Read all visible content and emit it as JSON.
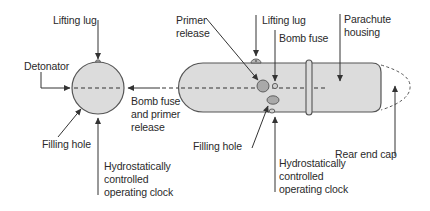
{
  "diagram": {
    "type": "technical-cutaway",
    "colors": {
      "background": "#ffffff",
      "body_fill": "#d9d9d9",
      "outline": "#444444",
      "component_fill": "#a9a9a9",
      "text": "#2a2a2a"
    },
    "left_sphere": {
      "labels": {
        "lifting_lug": "Lifting lug",
        "detonator": "Detonator",
        "filling_hole": "Filling hole",
        "clock": [
          "Hydrostatically",
          "controlled",
          "operating clock"
        ]
      }
    },
    "connector": {
      "label": [
        "Bomb fuse",
        "and primer",
        "release"
      ]
    },
    "right_body": {
      "labels": {
        "primer_release": [
          "Primer",
          "release"
        ],
        "lifting_lug": "Lifting lug",
        "bomb_fuse": "Bomb fuse",
        "parachute_housing": [
          "Parachute",
          "housing"
        ],
        "filling_hole": "Filling hole",
        "clock": [
          "Hydrostatically",
          "controlled",
          "operating clock"
        ],
        "rear_end_cap": "Rear end cap"
      }
    }
  }
}
